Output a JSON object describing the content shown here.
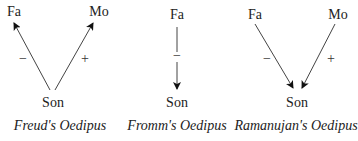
{
  "diagrams": [
    {
      "caption": "Freud's Oedipus",
      "nodes": {
        "father": "Fa",
        "mother": "Mo",
        "son": "Son"
      },
      "edges": [
        {
          "from": "Son",
          "to": "Fa",
          "sign": "−"
        },
        {
          "from": "Son",
          "to": "Mo",
          "sign": "+"
        }
      ]
    },
    {
      "caption": "Fromm's Oedipus",
      "nodes": {
        "father": "Fa",
        "son": "Son"
      },
      "edges": [
        {
          "from": "Fa",
          "to": "Son",
          "sign": "−"
        }
      ]
    },
    {
      "caption": "Ramanujan's Oedipus",
      "nodes": {
        "father": "Fa",
        "mother": "Mo",
        "son": "Son"
      },
      "edges": [
        {
          "from": "Fa",
          "to": "Son",
          "sign": "−"
        },
        {
          "from": "Mo",
          "to": "Son",
          "sign": "+"
        }
      ]
    }
  ]
}
